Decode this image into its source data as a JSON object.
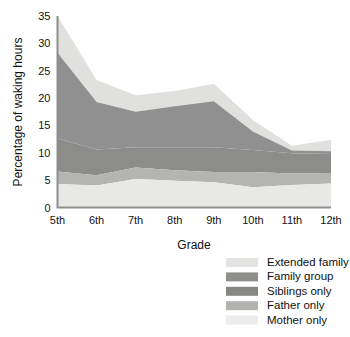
{
  "chart_data": {
    "type": "area",
    "stacked": true,
    "title": "",
    "xlabel": "Grade",
    "ylabel": "Percentage of waking hours",
    "categories": [
      "5th",
      "6th",
      "7th",
      "8th",
      "9th",
      "10th",
      "11th",
      "12th"
    ],
    "ylim": [
      0,
      35
    ],
    "yticks": [
      0,
      5,
      10,
      15,
      20,
      25,
      30,
      35
    ],
    "ytick_labels": [
      "0",
      "5",
      "10",
      "15",
      "20",
      "25",
      "30",
      "35"
    ],
    "grid": false,
    "legend_position": "bottom-right",
    "series": [
      {
        "name": "Mother only",
        "color": "#e8e8e6",
        "values": [
          4.3,
          4.0,
          5.2,
          4.9,
          4.6,
          3.7,
          4.1,
          4.4
        ]
      },
      {
        "name": "Father only",
        "color": "#b4b4b2",
        "values": [
          2.3,
          1.9,
          2.1,
          1.9,
          1.9,
          2.8,
          2.1,
          1.9
        ]
      },
      {
        "name": "Siblings only",
        "color": "#8c8c8a",
        "values": [
          6.0,
          4.7,
          3.7,
          4.2,
          4.5,
          4.0,
          3.7,
          3.5
        ]
      },
      {
        "name": "Family group",
        "color": "#909090",
        "values": [
          15.7,
          8.7,
          6.5,
          7.5,
          8.4,
          3.4,
          0.5,
          0.5
        ]
      },
      {
        "name": "Extended family",
        "color": "#e0e0de",
        "values": [
          3.9,
          4.0,
          3.0,
          2.8,
          3.2,
          2.1,
          0.9,
          2.1
        ]
      }
    ],
    "cumulative_tops": {
      "Mother only": [
        4.3,
        4.0,
        5.2,
        4.9,
        4.6,
        3.7,
        4.1,
        4.4
      ],
      "Father only": [
        6.6,
        5.9,
        7.3,
        6.8,
        6.5,
        6.5,
        6.2,
        6.3
      ],
      "Siblings only": [
        12.6,
        10.6,
        11.0,
        11.0,
        11.0,
        10.5,
        9.9,
        9.8
      ],
      "Family group": [
        28.3,
        19.3,
        17.5,
        18.5,
        19.4,
        13.9,
        10.4,
        10.3
      ],
      "Extended family": [
        32.2,
        23.3,
        20.5,
        21.3,
        22.6,
        16.0,
        11.3,
        12.4
      ]
    }
  },
  "legend": {
    "items": [
      {
        "label": "Extended family",
        "color": "#e3e3e1"
      },
      {
        "label": "Family group",
        "color": "#8f8f8d"
      },
      {
        "label": "Siblings only",
        "color": "#878785"
      },
      {
        "label": "Father only",
        "color": "#b2b2b0"
      },
      {
        "label": "Mother only",
        "color": "#ececea"
      }
    ]
  },
  "axes": {
    "y_title": "Percentage of waking hours",
    "x_title": "Grade"
  }
}
